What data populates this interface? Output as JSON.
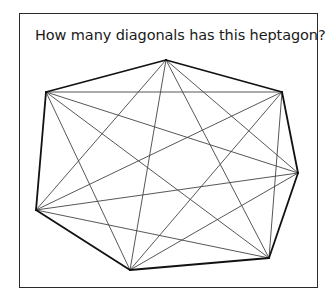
{
  "question": "How many diagonals has this heptagon?",
  "figure": {
    "shape": "heptagon",
    "vertex_count": 7,
    "vertex_labels": [
      "top",
      "upper-right",
      "right",
      "bottom-right",
      "bottom-left",
      "lower-left",
      "upper-left"
    ],
    "all_diagonals_drawn": true,
    "colors": {
      "edge": "#111111",
      "diagonal": "#444444",
      "frame": "#2a2a2a"
    }
  }
}
